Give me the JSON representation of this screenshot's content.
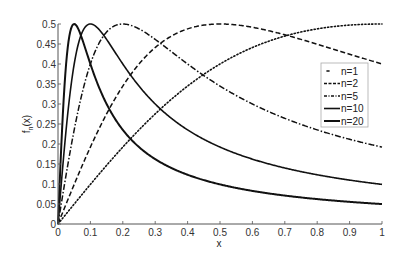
{
  "chart_data": {
    "type": "line",
    "title": "",
    "xlabel": "x",
    "ylabel": "f_n(x)",
    "xlim": [
      0,
      1
    ],
    "ylim": [
      0,
      0.5
    ],
    "grid": false,
    "legend_position": "right, inside plot",
    "x_ticks": [
      "0",
      "0.1",
      "0.2",
      "0.3",
      "0.4",
      "0.5",
      "0.6",
      "0.7",
      "0.8",
      "0.9",
      "1"
    ],
    "y_ticks": [
      "0",
      "0.05",
      "0.1",
      "0.15",
      "0.2",
      "0.25",
      "0.3",
      "0.35",
      "0.4",
      "0.45",
      "0.5"
    ],
    "formula": "f_n(x) = n x / (1 + n^2 x^2)",
    "x": [
      0,
      0.05,
      0.1,
      0.2,
      0.3,
      0.4,
      0.5,
      0.6,
      0.7,
      0.8,
      0.9,
      1.0
    ],
    "series": [
      {
        "name": "n=1",
        "n": 1,
        "style": "dotted",
        "values": [
          0,
          0.05,
          0.099,
          0.192,
          0.275,
          0.345,
          0.4,
          0.441,
          0.47,
          0.488,
          0.497,
          0.5
        ]
      },
      {
        "name": "n=2",
        "n": 2,
        "style": "dashed",
        "values": [
          0,
          0.099,
          0.192,
          0.345,
          0.441,
          0.488,
          0.5,
          0.49,
          0.467,
          0.44,
          0.411,
          0.4
        ]
      },
      {
        "name": "n=5",
        "n": 5,
        "style": "dashdot",
        "values": [
          0,
          0.235,
          0.4,
          0.5,
          0.46,
          0.4,
          0.345,
          0.3,
          0.264,
          0.235,
          0.212,
          0.192
        ]
      },
      {
        "name": "n=10",
        "n": 10,
        "style": "solid",
        "values": [
          0,
          0.4,
          0.5,
          0.4,
          0.3,
          0.235,
          0.192,
          0.162,
          0.14,
          0.123,
          0.11,
          0.099
        ]
      },
      {
        "name": "n=20",
        "n": 20,
        "style": "solid-thick",
        "values": [
          0,
          0.5,
          0.4,
          0.235,
          0.162,
          0.123,
          0.099,
          0.083,
          0.071,
          0.062,
          0.055,
          0.05
        ]
      }
    ]
  },
  "legend": {
    "items": [
      "n=1",
      "n=2",
      "n=5",
      "n=10",
      "n=20"
    ]
  },
  "axes": {
    "xlabel": "x",
    "ylabel_main": "f",
    "ylabel_sub": "n",
    "ylabel_tail": "(x)"
  }
}
